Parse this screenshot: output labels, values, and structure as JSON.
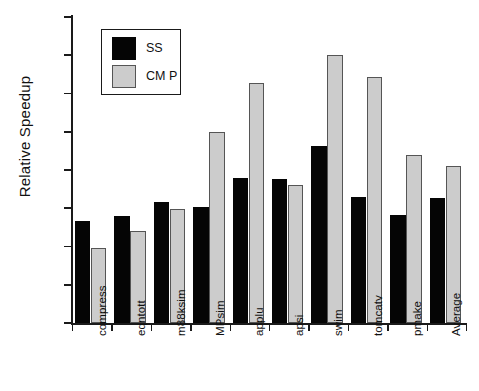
{
  "chart_data": {
    "type": "bar",
    "title": "",
    "xlabel": "",
    "ylabel": "Relative Speedup",
    "ylim": [
      0,
      4
    ],
    "yticks": [
      0,
      0.5,
      1,
      1.5,
      2,
      2.5,
      3,
      3.5,
      4
    ],
    "ytick_labels": [
      "0",
      "0.5",
      "1",
      "1.5",
      "2",
      "2.5",
      "3",
      "3.5",
      "4"
    ],
    "grid": false,
    "legend_position": "upper-left-inset",
    "categories": [
      "compress",
      "eqntott",
      "m88ksim",
      "MPsim",
      "applu",
      "apsi",
      "swim",
      "tomcatv",
      "pmake",
      "Average"
    ],
    "series": [
      {
        "name": "SS",
        "color": "#050505",
        "values": [
          1.33,
          1.4,
          1.58,
          1.51,
          1.9,
          1.88,
          2.32,
          1.65,
          1.41,
          1.64
        ]
      },
      {
        "name": "CM P",
        "color": "#cccccc",
        "values": [
          0.98,
          1.2,
          1.49,
          2.5,
          3.14,
          1.8,
          3.5,
          3.21,
          2.19,
          2.05
        ]
      }
    ]
  },
  "legend": {
    "entries": [
      {
        "label": "SS",
        "swatch": "black-square-icon"
      },
      {
        "label": "CM P",
        "swatch": "gray-square-icon"
      }
    ]
  }
}
